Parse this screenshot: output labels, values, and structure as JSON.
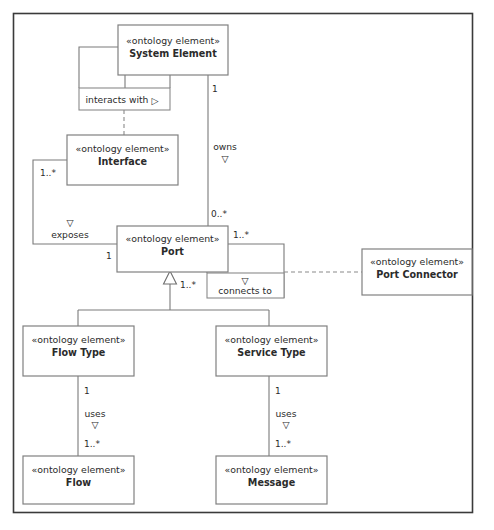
{
  "diagram": {
    "stereotype": "«ontology element»",
    "frame_color": "#3a3a3a",
    "box_border_color": "#808080",
    "line_color": "#7a7a7a",
    "text_color": "#2b2b2b",
    "classes": [
      {
        "id": "system-element",
        "stereotype": "«ontology element»",
        "name": "System Element"
      },
      {
        "id": "interface",
        "stereotype": "«ontology element»",
        "name": "Interface"
      },
      {
        "id": "port",
        "stereotype": "«ontology element»",
        "name": "Port"
      },
      {
        "id": "port-connector",
        "stereotype": "«ontology element»",
        "name": "Port Connector"
      },
      {
        "id": "flow-type",
        "stereotype": "«ontology element»",
        "name": "Flow Type"
      },
      {
        "id": "service-type",
        "stereotype": "«ontology element»",
        "name": "Service Type"
      },
      {
        "id": "flow",
        "stereotype": "«ontology element»",
        "name": "Flow"
      },
      {
        "id": "message",
        "stereotype": "«ontology element»",
        "name": "Message"
      }
    ],
    "association_labels": [
      {
        "id": "interacts-with",
        "text": "interacts with",
        "marker": "▷",
        "boxed": true
      },
      {
        "id": "connects-to",
        "text": "connects to",
        "marker": "▽",
        "boxed": true
      }
    ],
    "relations": [
      {
        "id": "owns",
        "label": "owns",
        "marker": "▽",
        "source": "System Element",
        "target": "Port",
        "source_multiplicity": "1",
        "target_multiplicity": "0..*"
      },
      {
        "id": "exposes",
        "label": "exposes",
        "marker": "▽",
        "source": "Interface",
        "target": "Port",
        "source_multiplicity": "1..*",
        "target_multiplicity": "1"
      },
      {
        "id": "connects-to-rel",
        "label": "connects to",
        "marker": "▽",
        "source": "Port",
        "target": "Port Connector",
        "source_multiplicity": "1..*",
        "target_multiplicity": ""
      },
      {
        "id": "uses-flow",
        "label": "uses",
        "marker": "▽",
        "source": "Flow Type",
        "target": "Flow",
        "source_multiplicity": "1",
        "target_multiplicity": "1..*"
      },
      {
        "id": "uses-message",
        "label": "uses",
        "marker": "▽",
        "source": "Service Type",
        "target": "Message",
        "source_multiplicity": "1",
        "target_multiplicity": "1..*"
      }
    ],
    "generalizations": [
      {
        "id": "port-generalization",
        "parent": "Port",
        "children": [
          "Flow Type",
          "Service Type"
        ],
        "multiplicity": "1..*"
      }
    ],
    "multiplicity_labels": {
      "sys_owns_source": "1",
      "port_owns_target": "0..*",
      "interface_exposes": "1..*",
      "port_exposes": "1",
      "port_connects": "1..*",
      "port_general": "1..*",
      "flowtype_uses": "1",
      "flow_uses": "1..*",
      "servicetype_uses": "1",
      "message_uses": "1..*"
    },
    "role_labels": {
      "owns": "owns",
      "exposes": "exposes",
      "uses_left": "uses",
      "uses_right": "uses",
      "interacts_with": "interacts with",
      "connects_to": "connects to"
    },
    "markers": {
      "filled_triangle_right": "▷",
      "open_triangle_down": "▽"
    }
  }
}
